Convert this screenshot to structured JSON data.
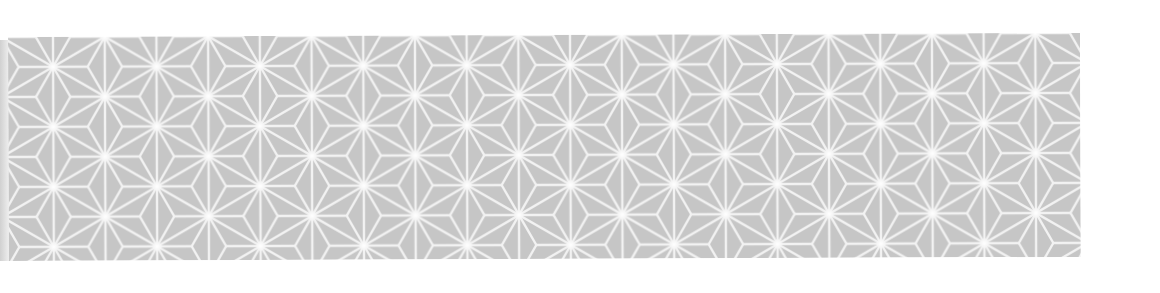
{
  "image": {
    "description": "Grey asanoha (hemp leaf) geometric pattern band on white background",
    "pattern_name": "asanoha",
    "colors": {
      "background": "#ffffff",
      "fill": "#c6c6c6",
      "line": "#f2f2f2",
      "star_glow": "#ffffff"
    },
    "band": {
      "x": 8,
      "y": 37,
      "width": 1072,
      "height": 224
    },
    "tile": {
      "width": 103.4,
      "height": 60
    }
  }
}
